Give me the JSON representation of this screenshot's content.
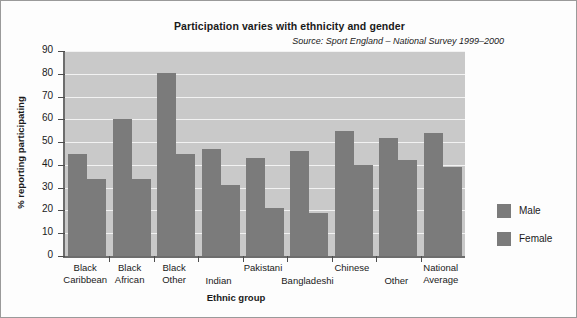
{
  "chart_data": {
    "type": "bar",
    "title": "Participation varies with ethnicity and gender",
    "subtitle": "Source: Sport England – National Survey 1999–2000",
    "xlabel": "Ethnic group",
    "ylabel": "% reporting participating",
    "ylim": [
      0,
      90
    ],
    "yticks": [
      0,
      10,
      20,
      30,
      40,
      50,
      60,
      70,
      80,
      90
    ],
    "ytick_labels": [
      "0",
      "10",
      "20",
      "30",
      "40",
      "50",
      "60",
      "70",
      "80",
      "90"
    ],
    "grid": true,
    "legend_position": "right",
    "categories": [
      "Black\nCaribbean",
      "Black\nAfrican",
      "Black\nOther",
      "Indian",
      "Pakistani",
      "Bangladeshi",
      "Chinese",
      "Other",
      "National\nAverage"
    ],
    "series": [
      {
        "name": "Male",
        "color": "#7b7b7b",
        "values": [
          45,
          60,
          80.5,
          47,
          43,
          46,
          55,
          52,
          54
        ]
      },
      {
        "name": "Female",
        "color": "#7b7b7b",
        "values": [
          34,
          34,
          45,
          31,
          21,
          19,
          40,
          42,
          39
        ]
      }
    ],
    "plot_background": "#c9c9c9",
    "gridline_color": "#f2f2f2",
    "axis_color": "#6d6d6d"
  }
}
